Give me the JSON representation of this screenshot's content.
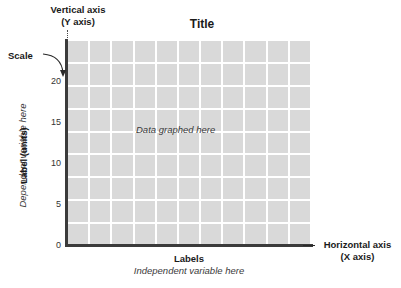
{
  "chart_data": {
    "type": "table",
    "title": "Title",
    "xlabel": "Labels",
    "ylabel": "Label (units)",
    "grid": true,
    "legend": "none",
    "categories": [],
    "values": [],
    "ylim": [
      0,
      22.5
    ],
    "y_ticks": [
      {
        "label": "20",
        "value": 20,
        "top_px": 76
      },
      {
        "label": "15",
        "value": 15,
        "top_px": 117
      },
      {
        "label": "10",
        "value": 10,
        "top_px": 158
      },
      {
        "label": "5",
        "value": 5,
        "top_px": 199
      },
      {
        "label": "0",
        "value": 0,
        "top_px": 240
      }
    ],
    "grid_columns": 11,
    "grid_rows": 9,
    "plot_note": "Data graphed here"
  },
  "chart": {
    "title": "Title",
    "data_note": "Data graphed here"
  },
  "y_axis": {
    "label_italic": "Dependent variable here",
    "label_bold": "Label (units)"
  },
  "x_axis": {
    "label_bold": "Labels",
    "label_italic": "Independent variable here"
  },
  "annotations": {
    "vertical_axis_line1": "Vertical axis",
    "vertical_axis_line2": "(Y axis)",
    "scale": "Scale",
    "horizontal_axis_line1": "Horizontal axis",
    "horizontal_axis_line2": "(X axis)"
  },
  "colors": {
    "grid_cell": "#d9d9d9",
    "axis_line": "#3b3b3b",
    "text_primary": "#1a1a1a",
    "text_secondary": "#3a3a3a",
    "background": "#ffffff"
  }
}
